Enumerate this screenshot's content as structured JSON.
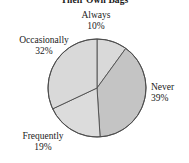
{
  "chart_data": {
    "type": "pie",
    "title": "Their Own Bags",
    "title_cropped": true,
    "xlabel": "",
    "ylabel": "",
    "legend": "none",
    "labels_position": "outside",
    "start_angle_deg": 90,
    "direction": "clockwise",
    "categories": [
      "Always",
      "Never",
      "Frequently",
      "Occasionally"
    ],
    "values": [
      10,
      39,
      19,
      32
    ],
    "value_suffix": "%",
    "slices": [
      {
        "label": "Always",
        "value": 10,
        "value_text": "10%",
        "color": "#d9d9d9",
        "start_deg": 0,
        "sweep_deg": 36
      },
      {
        "label": "Never",
        "value": 39,
        "value_text": "39%",
        "color": "#c4c4c4",
        "start_deg": 36,
        "sweep_deg": 140.4
      },
      {
        "label": "Frequently",
        "value": 19,
        "value_text": "19%",
        "color": "#dcdcdc",
        "start_deg": 176.4,
        "sweep_deg": 68.4
      },
      {
        "label": "Occasionally",
        "value": 32,
        "value_text": "32%",
        "color": "#d9d9d9",
        "start_deg": 244.8,
        "sweep_deg": 115.2
      }
    ],
    "geometry": {
      "center_x": 97,
      "center_y": 88,
      "radius": 49
    },
    "colors": {
      "outline": "#4d4d4d",
      "background": "#ffffff",
      "text": "#1a1a1a"
    }
  },
  "labels": {
    "always": {
      "name": "Always",
      "value": "10%"
    },
    "never": {
      "name": "Never",
      "value": "39%"
    },
    "frequently": {
      "name": "Frequently",
      "value": "19%"
    },
    "occasionally": {
      "name": "Occasionally",
      "value": "32%"
    }
  }
}
